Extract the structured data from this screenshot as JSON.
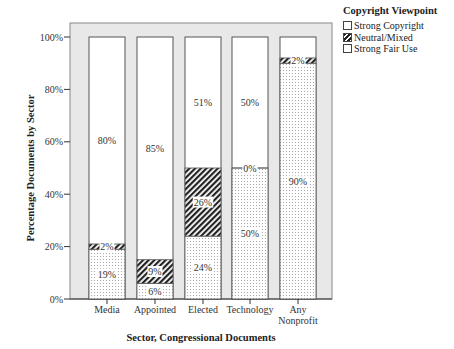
{
  "chart_data": {
    "type": "bar",
    "stacked": true,
    "percent": true,
    "title": "",
    "xlabel": "Sector, Congressional Documents",
    "ylabel": "Percentage Documents by Sector",
    "ylim": [
      0,
      100
    ],
    "yticks": [
      "0%",
      "20%",
      "40%",
      "60%",
      "80%",
      "100%"
    ],
    "grid": false,
    "legend_position": "right",
    "legend_title": "Copyright Viewpoint",
    "categories": [
      "Media",
      "Appointed",
      "Elected",
      "Technology",
      "Any Nonprofit"
    ],
    "series": [
      {
        "name": "Strong Fair Use",
        "values": [
          19,
          6,
          24,
          50,
          90
        ]
      },
      {
        "name": "Neutral/Mixed",
        "values": [
          2,
          9,
          26,
          0,
          2
        ]
      },
      {
        "name": "Strong Copyright",
        "values": [
          80,
          85,
          51,
          50,
          0
        ]
      }
    ],
    "bar_labels": [
      {
        "category": "Media",
        "Strong Fair Use": "19%",
        "Neutral/Mixed": "2%",
        "Strong Copyright": "80%"
      },
      {
        "category": "Appointed",
        "Strong Fair Use": "6%",
        "Neutral/Mixed": "9%",
        "Strong Copyright": "85%"
      },
      {
        "category": "Elected",
        "Strong Fair Use": "24%",
        "Neutral/Mixed": "26%",
        "Strong Copyright": "51%"
      },
      {
        "category": "Technology",
        "Strong Fair Use": "50%",
        "Neutral/Mixed": "0%",
        "Strong Copyright": "50%"
      },
      {
        "category": "Any Nonprofit",
        "Strong Fair Use": "90%",
        "Neutral/Mixed": "2%",
        "Strong Copyright": ""
      }
    ]
  },
  "legend": {
    "title": "Copyright Viewpoint",
    "items": [
      {
        "label": "Strong Copyright",
        "pattern": "white"
      },
      {
        "label": "Neutral/Mixed",
        "pattern": "hatched"
      },
      {
        "label": "Strong Fair Use",
        "pattern": "dotted"
      }
    ]
  },
  "colors": {
    "plot_background": "#e8e8e8",
    "bar_border": "#555555",
    "hatch": "#222222",
    "dots": "#888888"
  }
}
